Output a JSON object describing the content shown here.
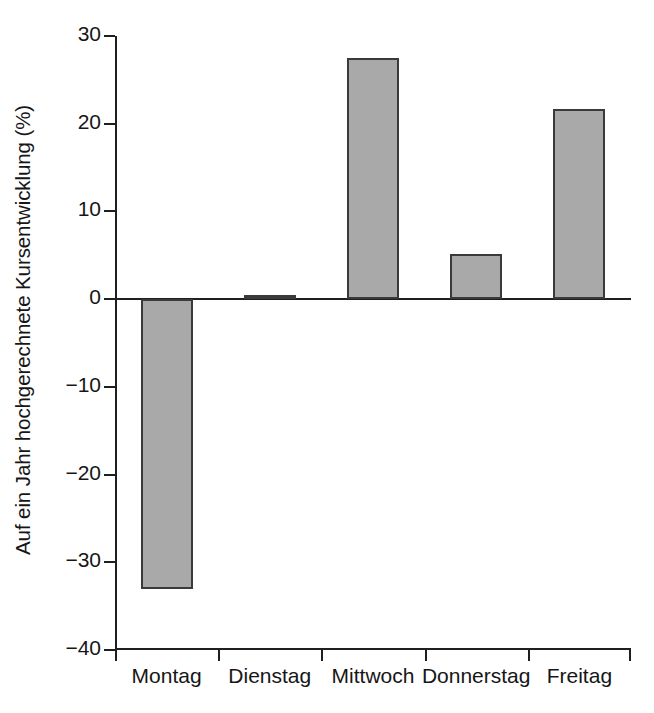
{
  "chart_data": {
    "type": "bar",
    "title": "",
    "subtitle": "",
    "xlabel": "",
    "ylabel": "Auf ein Jahr hochgerechnete Kursentwicklung (%)",
    "categories": [
      "Montag",
      "Dienstag",
      "Mittwoch",
      "Donnerstag",
      "Freitag"
    ],
    "values": [
      -33.0,
      0.5,
      27.5,
      5.1,
      21.7
    ],
    "ylim": [
      -40,
      30
    ],
    "yticks": [
      30,
      20,
      10,
      0,
      -10,
      -20,
      -30,
      -40
    ],
    "ytick_labels": [
      "30",
      "20",
      "10",
      "0",
      "-10",
      "-20",
      "-30",
      "-40"
    ],
    "grid": false,
    "legend": null,
    "bar_fill_color": "#a9a9a9",
    "bar_edge_color": "#3a3a3a",
    "axis_color": "#1f1f1f",
    "background_color": "#ffffff",
    "zero_reference_line": 0
  }
}
